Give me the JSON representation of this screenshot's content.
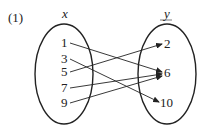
{
  "problem_label": "(1)",
  "domain_set": {
    "name": "x",
    "elements": [
      "1",
      "3",
      "5",
      "7",
      "9"
    ]
  },
  "codomain_set": {
    "name": "y",
    "elements": [
      "2",
      "6",
      "10"
    ]
  },
  "mappings": [
    {
      "from": "1",
      "to": "6"
    },
    {
      "from": "3",
      "to": "10"
    },
    {
      "from": "5",
      "to": "2"
    },
    {
      "from": "7",
      "to": "6"
    },
    {
      "from": "9",
      "to": "6"
    }
  ],
  "colors": {
    "stroke": "#222222",
    "background": "#ffffff"
  }
}
